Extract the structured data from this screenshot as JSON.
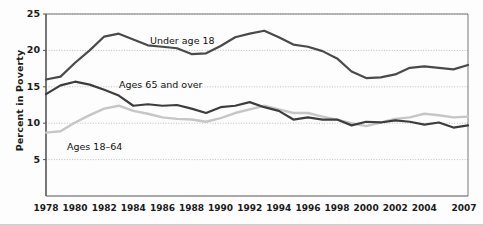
{
  "chart_data": {
    "type": "line",
    "title": "",
    "subtitle": "",
    "xlabel": "",
    "ylabel": "Percent in Poverty",
    "xlim": [
      1978,
      2007
    ],
    "ylim": [
      0,
      25
    ],
    "yticks": [
      5,
      10,
      15,
      20,
      25
    ],
    "xticks": [
      "1978",
      "1980",
      "1982",
      "1984",
      "1986",
      "1988",
      "1990",
      "1992",
      "1994",
      "1996",
      "1998",
      "2000",
      "2002",
      "2004",
      "2007"
    ],
    "grid": "horizontal-dotted",
    "legend": "inline-annotations",
    "x": [
      1978,
      1979,
      1980,
      1981,
      1982,
      1983,
      1984,
      1985,
      1986,
      1987,
      1988,
      1989,
      1990,
      1991,
      1992,
      1993,
      1994,
      1995,
      1996,
      1997,
      1998,
      1999,
      2000,
      2001,
      2002,
      2003,
      2004,
      2005,
      2006,
      2007
    ],
    "series": [
      {
        "name": "Under age 18",
        "color": "#4a4a4a",
        "values": [
          16.0,
          16.4,
          18.3,
          20.0,
          21.9,
          22.3,
          21.5,
          20.7,
          20.5,
          20.3,
          19.5,
          19.6,
          20.6,
          21.8,
          22.3,
          22.7,
          21.8,
          20.8,
          20.5,
          19.9,
          18.9,
          17.1,
          16.2,
          16.3,
          16.7,
          17.6,
          17.8,
          17.6,
          17.4,
          18.0
        ]
      },
      {
        "name": "Ages 65 and over",
        "color": "#3d3d3d",
        "values": [
          14.0,
          15.2,
          15.7,
          15.3,
          14.6,
          13.8,
          12.4,
          12.6,
          12.4,
          12.5,
          12.0,
          11.4,
          12.2,
          12.4,
          12.9,
          12.2,
          11.7,
          10.5,
          10.8,
          10.5,
          10.5,
          9.7,
          10.2,
          10.1,
          10.4,
          10.2,
          9.8,
          10.1,
          9.4,
          9.7
        ]
      },
      {
        "name": "Ages 18–64",
        "color": "#c6c6c6",
        "values": [
          8.7,
          8.9,
          10.1,
          11.1,
          12.0,
          12.4,
          11.7,
          11.3,
          10.8,
          10.6,
          10.5,
          10.2,
          10.7,
          11.4,
          11.9,
          12.4,
          11.9,
          11.4,
          11.4,
          10.9,
          10.5,
          10.0,
          9.6,
          10.1,
          10.6,
          10.8,
          11.3,
          11.1,
          10.8,
          10.9
        ]
      }
    ],
    "annotations": [
      {
        "name": "under-18-label",
        "text": "Under age 18",
        "x_px": 150,
        "y_px": 35
      },
      {
        "name": "ages-65-label",
        "text": "Ages 65 and over",
        "x_px": 119,
        "y_px": 79
      },
      {
        "name": "ages-18-64-label",
        "text": "Ages 18–64",
        "x_px": 67,
        "y_px": 141
      }
    ],
    "colors": {
      "axis": "#555555",
      "grid": "#b9b9b9",
      "text": "#1a1a1a",
      "background": "#fdfdfd"
    }
  }
}
